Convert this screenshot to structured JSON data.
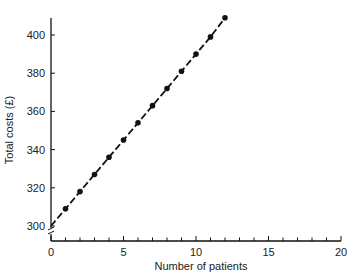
{
  "chart_data": {
    "type": "line",
    "title": "",
    "xlabel": "Number of patients",
    "ylabel": "Total costs (£)",
    "xlim": [
      0,
      20
    ],
    "ylim": [
      300,
      410
    ],
    "x_ticks_major": [
      0,
      5,
      10,
      15,
      20
    ],
    "y_ticks_major": [
      300,
      320,
      340,
      360,
      380,
      400
    ],
    "y_axis_break": true,
    "grid": false,
    "legend": null,
    "series": [
      {
        "name": "Total costs",
        "line_style": "dashed",
        "marker": "filled-circle",
        "intercept": 300,
        "x": [
          1,
          2,
          3,
          4,
          5,
          6,
          7,
          8,
          9,
          10,
          11,
          12
        ],
        "values": [
          309,
          318,
          327,
          336,
          345,
          354,
          363,
          372,
          381,
          390,
          399,
          409
        ]
      }
    ]
  }
}
